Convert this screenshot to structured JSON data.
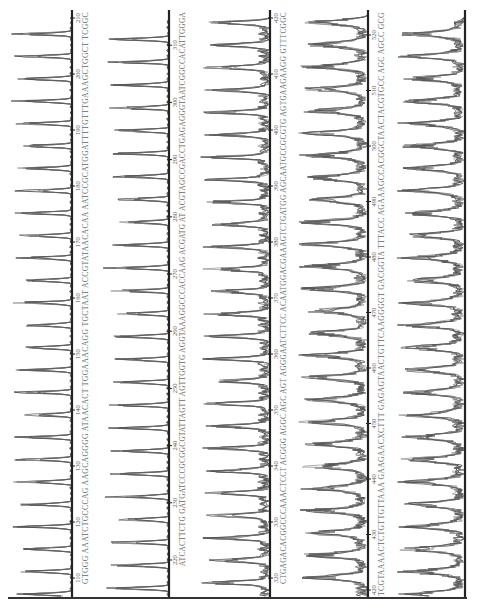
{
  "chart_data": {
    "type": "line",
    "title": "",
    "xlabel": "base position",
    "ylabel": "fluorescence intensity",
    "grid": false,
    "legend": null,
    "orientation": "rotated-90-ccw",
    "panels": [
      {
        "id": 1,
        "range": [
          110,
          210
        ],
        "ticks": [
          110,
          120,
          130,
          140,
          150,
          160,
          170,
          180,
          190,
          200,
          210
        ],
        "sequence": "GTGGG AAATCTGCCCAG AAGCAGGGG ATAACACT TGGAAACAGG TGCTAAT ACCGTATAACACAA AATCCGCATGGATTTTGTTTGAAAGCTGGCT TCGGC",
        "trace_quality": "clean, sharp high peaks"
      },
      {
        "id": 2,
        "range": [
          220,
          310
        ],
        "ticks": [
          220,
          230,
          240,
          250,
          260,
          270,
          280,
          290,
          300,
          310
        ],
        "sequence": "ATCACTTCTG GATGATCCCGCGGCGTATTAGTT AGTTGGTG AGGTAAAGGCCCACCAAG ACGATG AT ACGTAGCCGACCTGAGAGGGTAATCGGCCACATTGGGA",
        "trace_quality": "clean, sharp high peaks"
      },
      {
        "id": 3,
        "range": [
          320,
          420
        ],
        "ticks": [
          320,
          330,
          340,
          350,
          360,
          370,
          380,
          390,
          400,
          410,
          420
        ],
        "sequence": "CTGAGACACGGCCCAAACTCCT ACGGG AGGC AGC AGT AGGGAATCTTCC ACAATGGACGAAAGTCTGATGG AGCAATGCCGCGTG AGTGAAGAAGG GTTTCGGC",
        "trace_quality": "mixed, broader peaks"
      },
      {
        "id": 4,
        "range": [
          420,
          520
        ],
        "ticks": [
          420,
          430,
          440,
          450,
          460,
          470,
          480,
          490,
          500,
          510,
          520
        ],
        "sequence": "TCGTAAAACTCTGTTGTTAAA GAAGAACXCTTT GAGAGTAACTGTTCAAGGGGT GACGGTA TTTACC AGAAAGCCACGGCTAACTACGTGCC AGC AGCC GCG",
        "trace_quality": "noisy, broad overlapping peaks"
      },
      {
        "id": 5,
        "range": [
          null,
          null
        ],
        "ticks": [],
        "sequence": "",
        "trace_quality": "very noisy, low resolution"
      }
    ]
  }
}
